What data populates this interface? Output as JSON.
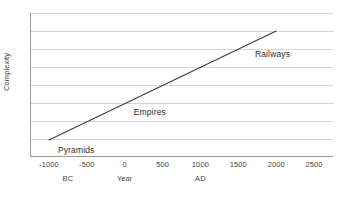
{
  "chart_data": {
    "type": "line",
    "title": "",
    "subtitle": "",
    "xlabel": "Year",
    "ylabel": "Complexity",
    "xlim": [
      -1250,
      2750
    ],
    "ylim": [
      0,
      8
    ],
    "grid": true,
    "legend": false,
    "x_tick_labels": [
      "-1000",
      "-500",
      "0",
      "500",
      "1000",
      "1500",
      "2000",
      "2500"
    ],
    "x_tick_values": [
      -1000,
      -500,
      0,
      500,
      1000,
      1500,
      2000,
      2500
    ],
    "y_tick_labels": [],
    "gridline_count": 8,
    "era_labels": [
      {
        "text": "BC",
        "x": -750
      },
      {
        "text": "Year",
        "x": 0
      },
      {
        "text": "AD",
        "x": 1000
      }
    ],
    "series": [
      {
        "name": "Complexity",
        "color": "#3b3b3b",
        "x": [
          -1000,
          2000
        ],
        "values": [
          0.95,
          7.0
        ]
      }
    ],
    "annotations": [
      {
        "text": "Pyramids",
        "x": -1000,
        "y": 0.35
      },
      {
        "text": "Empires",
        "x": 0,
        "y": 2.45
      },
      {
        "text": "Railways",
        "x": 1600,
        "y": 5.65
      }
    ]
  },
  "axis_colors": {
    "axis_line": "#9a9a9a",
    "gridline": "#d5d5d5",
    "series_line": "#3b3b3b",
    "text": "#3f3f3f",
    "background": "#ffffff"
  }
}
